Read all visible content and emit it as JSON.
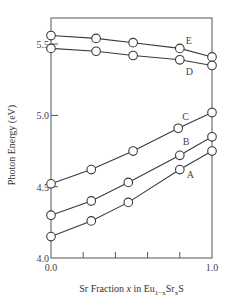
{
  "chart_data": {
    "type": "line",
    "title": "",
    "xlabel": "Sr Fraction x in Eu1−xSrxS",
    "xlabel_parts": {
      "pre": "Sr Fraction ",
      "var": "x",
      "mid": " in Eu",
      "sub1": "1−x",
      "mid2": "Sr",
      "sub2": "x",
      "post": "S"
    },
    "ylabel": "Photon Energy (eV)",
    "xlim": [
      0.0,
      1.0
    ],
    "ylim": [
      4.0,
      5.65
    ],
    "x_tick_labels": [
      "0.0",
      "1.0"
    ],
    "x_ticks": [
      0.0,
      0.2,
      0.4,
      0.6,
      0.8,
      1.0
    ],
    "y_ticks": [
      4.0,
      4.5,
      5.0,
      5.5
    ],
    "y_tick_labels": [
      "4.0",
      "4.5",
      "5.0",
      "5.5"
    ],
    "grid": false,
    "legend": "inline labels",
    "series": [
      {
        "name": "E",
        "x": [
          0.0,
          0.28,
          0.51,
          0.8,
          1.0
        ],
        "values": [
          5.56,
          5.54,
          5.51,
          5.47,
          5.41
        ]
      },
      {
        "name": "D",
        "x": [
          0.0,
          0.28,
          0.51,
          0.8,
          1.0
        ],
        "values": [
          5.47,
          5.45,
          5.42,
          5.39,
          5.35
        ]
      },
      {
        "name": "C",
        "x": [
          0.0,
          0.25,
          0.51,
          0.79,
          1.0
        ],
        "values": [
          4.52,
          4.62,
          4.75,
          4.91,
          5.02
        ]
      },
      {
        "name": "B",
        "x": [
          0.0,
          0.25,
          0.48,
          0.8,
          1.0
        ],
        "values": [
          4.3,
          4.4,
          4.53,
          4.72,
          4.85
        ]
      },
      {
        "name": "A",
        "x": [
          0.0,
          0.25,
          0.48,
          0.8,
          1.0
        ],
        "values": [
          4.15,
          4.26,
          4.39,
          4.62,
          4.75
        ]
      }
    ]
  },
  "labels": {
    "ylabel": "Photon Energy (eV)"
  }
}
